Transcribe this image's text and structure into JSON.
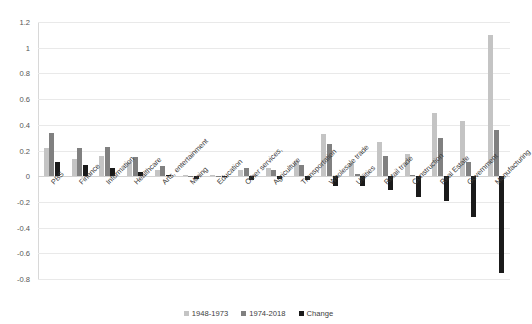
{
  "chart_data": {
    "type": "bar",
    "title": "",
    "xlabel": "",
    "ylabel": "",
    "ylim": [
      -0.8,
      1.2
    ],
    "ytick_step": 0.2,
    "yticks": [
      1.2,
      1,
      0.8,
      0.6,
      0.4,
      0.2,
      0,
      -0.2,
      -0.4,
      -0.6,
      -0.8
    ],
    "ytick_labels": [
      "1.2",
      "1",
      "0.8",
      "0.6",
      "0.4",
      "0.2",
      "0",
      "-0.2",
      "-0.4",
      "-0.6",
      "-0.8"
    ],
    "grid": true,
    "legend_position": "bottom",
    "categories": [
      "PBS",
      "Finance",
      "Information",
      "Healthcare",
      "Arts, entertainment",
      "Mining",
      "Education",
      "Other services,",
      "Agriculture",
      "Transportation",
      "Wholesale trade",
      "Utilities",
      "Retail trade",
      "Construction",
      "Real Estate",
      "Government",
      "Manufacturing"
    ],
    "series": [
      {
        "name": "1948-1973",
        "color": "#c4c4c4",
        "values": [
          0.22,
          0.13,
          0.16,
          0.11,
          0.05,
          0.01,
          0.01,
          0.05,
          0.06,
          0.12,
          0.33,
          0.1,
          0.27,
          0.17,
          0.49,
          0.43,
          1.1
        ]
      },
      {
        "name": "1974-2018",
        "color": "#808080",
        "values": [
          0.34,
          0.22,
          0.23,
          0.15,
          0.08,
          0.005,
          0.005,
          0.06,
          0.05,
          0.09,
          0.25,
          0.02,
          0.16,
          0.01,
          0.3,
          0.11,
          0.36
        ]
      },
      {
        "name": "Change",
        "color": "#1a1a1a",
        "values": [
          0.11,
          0.09,
          0.06,
          0.03,
          0.01,
          -0.02,
          -0.01,
          -0.03,
          -0.02,
          -0.03,
          -0.08,
          -0.08,
          -0.11,
          -0.16,
          -0.19,
          -0.32,
          -0.75
        ]
      }
    ]
  },
  "legend": {
    "items": [
      {
        "label": "1948-1973",
        "color": "#c4c4c4"
      },
      {
        "label": "1974-2018",
        "color": "#808080"
      },
      {
        "label": "Change",
        "color": "#1a1a1a"
      }
    ]
  }
}
